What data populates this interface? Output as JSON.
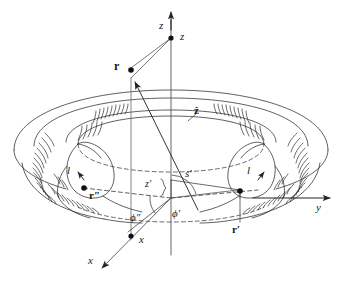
{
  "figure": {
    "kind": "toroidal-coil-geometry-diagram",
    "stroke_color": "#2b2b2b",
    "dash_color": "#3a3a3a",
    "background": "#ffffff"
  },
  "axes": {
    "z_arrow_label": "z",
    "z_point_label": "z",
    "x_arrow_label": "x",
    "x_point_label": "x",
    "y_arrow_label": "y"
  },
  "vectors": {
    "r": "r",
    "r_prime": "r′",
    "r_double_prime": "r″",
    "z_hat": "ẑ"
  },
  "angles": {
    "phi_double_prime": "ϕ″",
    "phi_prime": "ϕ′"
  },
  "lengths": {
    "s_prime": "s′",
    "z_prime": "z′",
    "loop_left": "l",
    "loop_right": "l"
  }
}
